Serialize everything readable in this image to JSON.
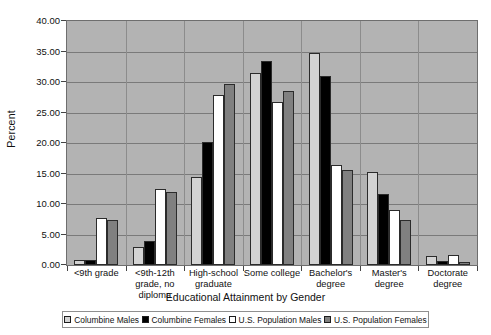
{
  "chart_data": {
    "type": "bar",
    "title": "",
    "xlabel": "Educational Attainment by Gender",
    "ylabel": "Percent",
    "ylim": [
      0,
      40
    ],
    "ytick_step": 5,
    "ytick_labels": [
      "40.00",
      "35.00",
      "30.00",
      "25.00",
      "20.00",
      "15.00",
      "10.00",
      "5.00",
      "0.00"
    ],
    "ytick_values": [
      40,
      35,
      30,
      25,
      20,
      15,
      10,
      5,
      0
    ],
    "grid": true,
    "legend_position": "bottom",
    "plot_background": "#b3b3b3",
    "categories": [
      "<9th  grade",
      "<9th-12th grade, no diploma",
      "High-school graduate",
      "Some college",
      "Bachelor's degree",
      "Master's degree",
      "Doctorate degree"
    ],
    "series": [
      {
        "name": "Columbine Males",
        "color": "#d3d3d3",
        "values": [
          0.8,
          3.0,
          14.5,
          31.5,
          34.7,
          15.3,
          1.4
        ]
      },
      {
        "name": "Columbine Females",
        "color": "#000000",
        "values": [
          0.8,
          3.9,
          20.2,
          33.4,
          31.0,
          11.7,
          0.6
        ]
      },
      {
        "name": "U.S. Population Males",
        "color": "#ffffff",
        "values": [
          7.7,
          12.4,
          27.9,
          26.7,
          16.4,
          9.0,
          1.7
        ]
      },
      {
        "name": "U.S. Population Females",
        "color": "#808080",
        "values": [
          7.3,
          11.9,
          29.6,
          28.5,
          15.6,
          7.3,
          0.5
        ]
      }
    ]
  }
}
